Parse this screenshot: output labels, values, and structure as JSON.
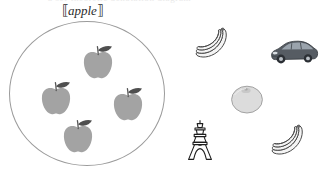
{
  "figure": {
    "caption_clipped": "a set-theoretic denotation diagram",
    "background_color": "#ffffff",
    "width": 330,
    "height": 176
  },
  "set": {
    "label_open_bracket": "⟦",
    "label_text": "apple",
    "label_close_bracket": "⟧",
    "label_full": "⟦apple⟧",
    "outline_color": "#9b9b9b",
    "member_count": 4,
    "members": [
      {
        "name": "apple",
        "index": 1,
        "x": 78,
        "y": 43,
        "fill": "#a3a3a3"
      },
      {
        "name": "apple",
        "index": 2,
        "x": 36,
        "y": 79,
        "fill": "#a3a3a3"
      },
      {
        "name": "apple",
        "index": 3,
        "x": 108,
        "y": 85,
        "fill": "#a3a3a3"
      },
      {
        "name": "apple",
        "index": 4,
        "x": 58,
        "y": 117,
        "fill": "#a3a3a3"
      }
    ]
  },
  "non_members": [
    {
      "name": "banana-bunch",
      "index": 1,
      "x": 190,
      "y": 27,
      "fill": "#f2f2f2",
      "stroke": "#4a4a4a"
    },
    {
      "name": "car",
      "index": 1,
      "x": 269,
      "y": 39,
      "fill": "#5a5f66",
      "stroke": "#2e3338"
    },
    {
      "name": "orange",
      "index": 1,
      "x": 230,
      "y": 84,
      "fill": "#dcdcdc",
      "stroke": "#9a9a9a"
    },
    {
      "name": "tower",
      "index": 1,
      "x": 186,
      "y": 119,
      "fill": "#ffffff",
      "stroke": "#1e1e1e"
    },
    {
      "name": "banana-bunch",
      "index": 2,
      "x": 266,
      "y": 124,
      "fill": "#f2f2f2",
      "stroke": "#4a4a4a"
    }
  ],
  "colors": {
    "apple_fill": "#a3a3a3",
    "apple_leaf": "#4f4f4f",
    "apple_stem": "#555555",
    "circle_stroke": "#9b9b9b",
    "banana_fill": "#f4f4f4",
    "banana_stroke": "#4a4a4a",
    "car_body": "#565c63",
    "orange_fill": "#dcdcdc",
    "tower_stroke": "#1e1e1e",
    "label_text": "#2b2b2b"
  }
}
